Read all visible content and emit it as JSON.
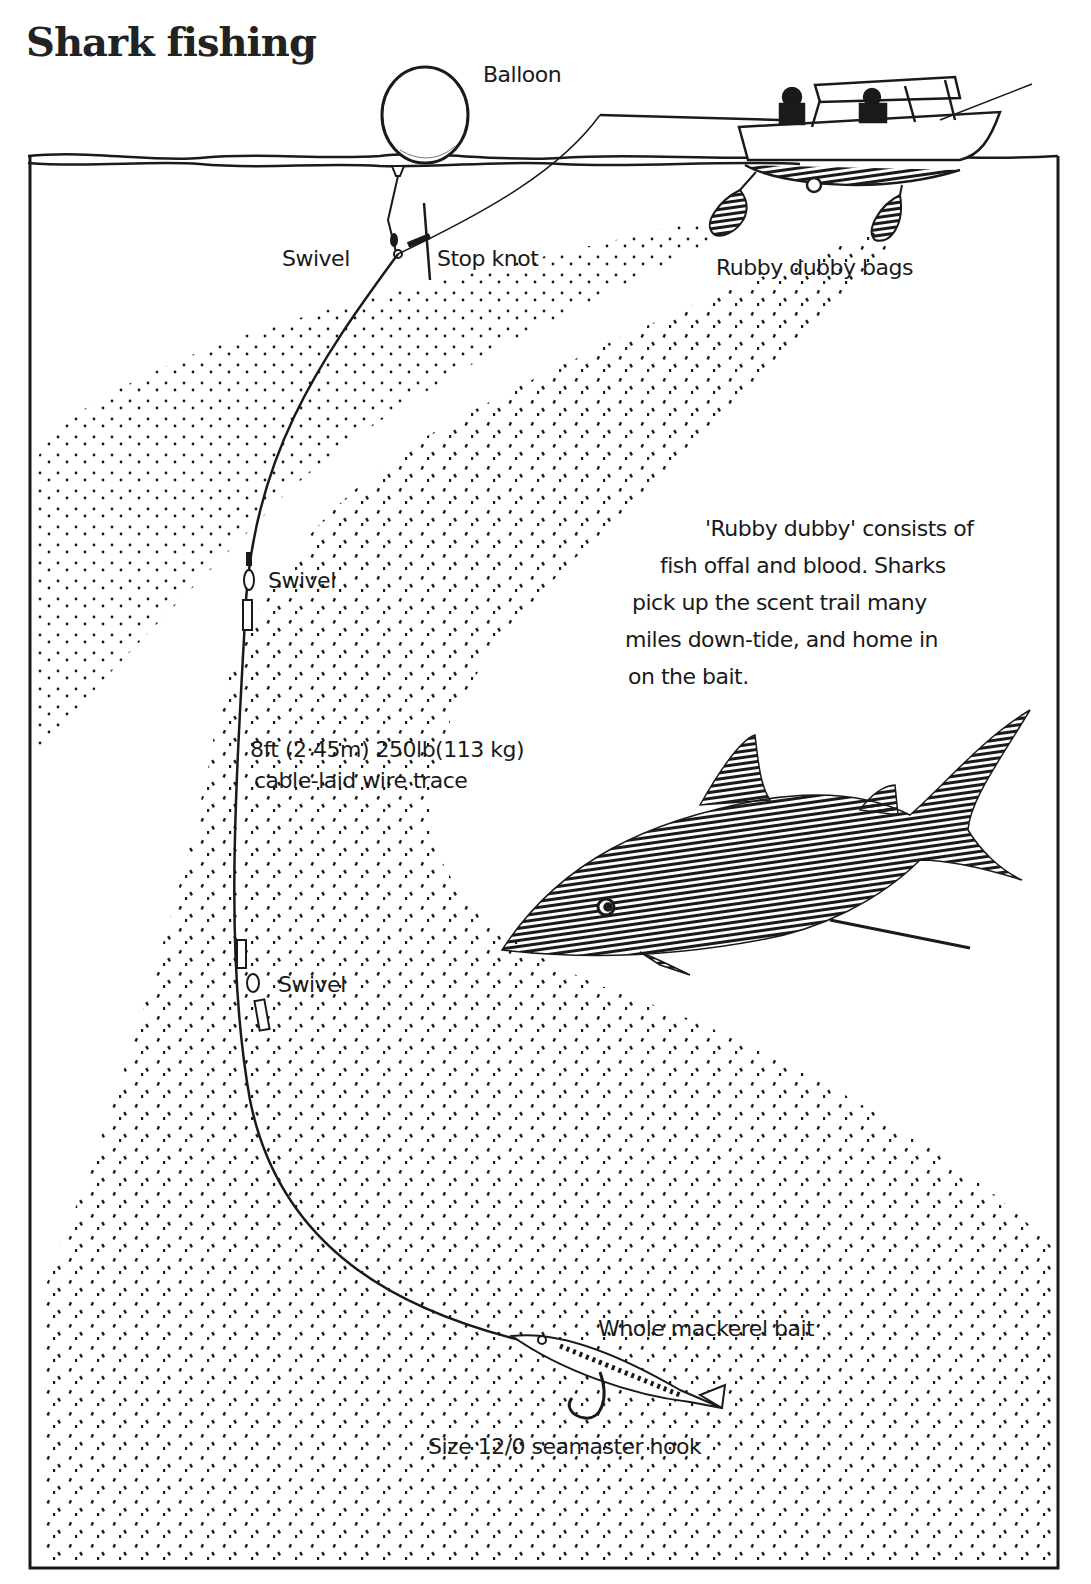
{
  "title": "Shark fishing",
  "labels": {
    "balloon": "Balloon",
    "swivel_top": "Swivel",
    "stop_knot": "Stop knot",
    "rubby_dubby_bags": "Rubby dubby bags",
    "swivel_mid": "Swivel",
    "trace_line1": "8ft (2·45m) 250lb(113 kg)",
    "trace_line2": "cable-laid wire trace",
    "swivel_low": "Swivel",
    "bait": "Whole mackerel bait",
    "hook": "Size 12/0 seamaster hook"
  },
  "note": {
    "lines": [
      "'Rubby dubby' consists of",
      "fish offal and blood.  Sharks",
      "pick up the scent trail many",
      "miles down-tide, and home in",
      "on the bait."
    ]
  },
  "colors": {
    "ink": "#1a1a1a",
    "paper": "#ffffff"
  }
}
